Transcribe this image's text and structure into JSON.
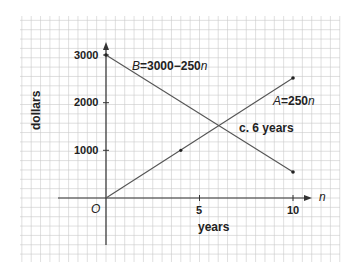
{
  "chart_data": {
    "type": "line",
    "title": "",
    "xlabel": "years",
    "ylabel": "dollars",
    "x_axis_symbol": "n",
    "origin_label": "O",
    "xlim": [
      0,
      10
    ],
    "ylim": [
      0,
      3000
    ],
    "x_ticks": [
      5,
      10
    ],
    "x_tick_labels": [
      "5",
      "10"
    ],
    "y_ticks": [
      1000,
      2000,
      3000
    ],
    "y_tick_labels": [
      "1000",
      "2000",
      "3000"
    ],
    "grid": true,
    "series": [
      {
        "name": "A",
        "label": "A = 250n",
        "x": [
          0,
          4,
          10
        ],
        "values": [
          0,
          1000,
          2500
        ],
        "color": "#555555"
      },
      {
        "name": "B",
        "label": "B = 3000 − 250n",
        "x": [
          0,
          10
        ],
        "values": [
          3000,
          500
        ],
        "color": "#555555"
      }
    ],
    "annotations": [
      {
        "text": "c. 6 years",
        "x": 6,
        "y": 1500
      }
    ],
    "legend_position": "inline"
  },
  "labels": {
    "series_a_var": "A",
    "series_a_eq": "=250",
    "series_a_n": "n",
    "series_b_var": "B",
    "series_b_eq": "=3000−250",
    "series_b_n": "n",
    "intersection": "c.  6 years",
    "ylabel": "dollars",
    "xlabel": "years",
    "x_axis_symbol": "n",
    "origin": "O",
    "y1000": "1000",
    "y2000": "2000",
    "y3000": "3000",
    "x5": "5",
    "x10": "10"
  },
  "colors": {
    "grid": "#c9c9c9",
    "axis": "#333333",
    "line": "#555555",
    "text": "#222222"
  }
}
